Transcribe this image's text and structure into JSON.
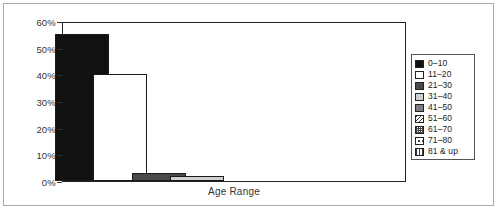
{
  "chart_data": {
    "type": "bar",
    "title": "",
    "xlabel": "Age Range",
    "ylabel": "",
    "categories": [
      "0–10",
      "11–20",
      "21–30",
      "31–40",
      "41–50",
      "51–60",
      "61–70",
      "71–80",
      "81 & up"
    ],
    "values": [
      55,
      40,
      3,
      2,
      0,
      0,
      0,
      0,
      0
    ],
    "value_unit": "%",
    "ylim": [
      0,
      60
    ],
    "ytick_labels": [
      "0%",
      "10%",
      "20%",
      "30%",
      "40%",
      "50%",
      "60%"
    ],
    "ytick_values": [
      0,
      10,
      20,
      30,
      40,
      50,
      60
    ],
    "grid": false,
    "legend_position": "right",
    "series": [
      {
        "name": "Age Range distribution",
        "points": [
          {
            "category": "0–10",
            "value": 55,
            "fill": "solid-black",
            "fill_color": "#111111"
          },
          {
            "category": "11–20",
            "value": 40,
            "fill": "white",
            "fill_color": "#ffffff"
          },
          {
            "category": "21–30",
            "value": 3,
            "fill": "dark-gray",
            "fill_color": "#4a4a4a"
          },
          {
            "category": "31–40",
            "value": 2,
            "fill": "light-gray",
            "fill_color": "#cfcfcf"
          },
          {
            "category": "41–50",
            "value": 0,
            "fill": "medium-gray",
            "fill_color": "#7d7d7d"
          },
          {
            "category": "51–60",
            "value": 0,
            "fill": "diagonal-hatch",
            "fill_color": "#ffffff"
          },
          {
            "category": "61–70",
            "value": 0,
            "fill": "checker",
            "fill_color": "#ffffff"
          },
          {
            "category": "71–80",
            "value": 0,
            "fill": "sparse-dots",
            "fill_color": "#ffffff"
          },
          {
            "category": "81 & up",
            "value": 0,
            "fill": "vertical-stripes",
            "fill_color": "#ffffff"
          }
        ]
      }
    ]
  },
  "axis": {
    "x_title": "Age Range"
  },
  "legend": {
    "entries": [
      {
        "label": "0–10",
        "fill": "solid-black"
      },
      {
        "label": "11–20",
        "fill": "white"
      },
      {
        "label": "21–30",
        "fill": "dark-gray"
      },
      {
        "label": "31–40",
        "fill": "light-gray"
      },
      {
        "label": "41–50",
        "fill": "medium-gray"
      },
      {
        "label": "51–60",
        "fill": "diagonal-hatch"
      },
      {
        "label": "61–70",
        "fill": "checker"
      },
      {
        "label": "71–80",
        "fill": "sparse-dots"
      },
      {
        "label": "81 & up",
        "fill": "vertical-stripes"
      }
    ]
  },
  "colors": {
    "frame": "#aaaaaa",
    "axis": "#222222",
    "text": "#333333"
  }
}
